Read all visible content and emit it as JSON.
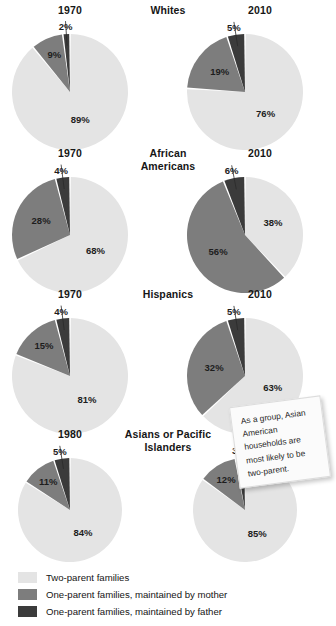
{
  "colors": {
    "two_parent": "#e4e4e4",
    "mother": "#7d7d7d",
    "father": "#3b3b3b",
    "background": "#ffffff",
    "text": "#1a1a1a",
    "gap": "#ffffff"
  },
  "legend": {
    "items": [
      {
        "label": "Two-parent families",
        "color_key": "two_parent",
        "swatch_name": "legend-swatch-two-parent"
      },
      {
        "label": "One-parent families, maintained by mother",
        "color_key": "mother",
        "swatch_name": "legend-swatch-mother"
      },
      {
        "label": "One-parent families, maintained by father",
        "color_key": "father",
        "swatch_name": "legend-swatch-father"
      }
    ]
  },
  "callout": {
    "text": "As a group, Asian American households are most likely to be two-parent."
  },
  "chart_data": {
    "type": "pie",
    "series_labels": [
      "Two-parent families",
      "One-parent families, maintained by mother",
      "One-parent families, maintained by father"
    ],
    "units": "percent",
    "groups": [
      {
        "name": "Whites",
        "name_lines": [
          "Whites"
        ],
        "panels": [
          {
            "year": "1970",
            "values": {
              "two_parent": 89,
              "mother": 9,
              "father": 2
            },
            "labels": {
              "two_parent": "89%",
              "mother": "9%",
              "father": "2%"
            }
          },
          {
            "year": "2010",
            "values": {
              "two_parent": 76,
              "mother": 19,
              "father": 5
            },
            "labels": {
              "two_parent": "76%",
              "mother": "19%",
              "father": "5%"
            }
          }
        ]
      },
      {
        "name": "African Americans",
        "name_lines": [
          "African",
          "Americans"
        ],
        "panels": [
          {
            "year": "1970",
            "values": {
              "two_parent": 68,
              "mother": 28,
              "father": 4
            },
            "labels": {
              "two_parent": "68%",
              "mother": "28%",
              "father": "4%"
            }
          },
          {
            "year": "2010",
            "values": {
              "two_parent": 38,
              "mother": 56,
              "father": 6
            },
            "labels": {
              "two_parent": "38%",
              "mother": "56%",
              "father": "6%"
            }
          }
        ]
      },
      {
        "name": "Hispanics",
        "name_lines": [
          "Hispanics"
        ],
        "panels": [
          {
            "year": "1970",
            "values": {
              "two_parent": 81,
              "mother": 15,
              "father": 4
            },
            "labels": {
              "two_parent": "81%",
              "mother": "15%",
              "father": "4%"
            }
          },
          {
            "year": "2010",
            "values": {
              "two_parent": 63,
              "mother": 32,
              "father": 5
            },
            "labels": {
              "two_parent": "63%",
              "mother": "32%",
              "father": "5%"
            }
          }
        ]
      },
      {
        "name": "Asians or Pacific Islanders",
        "name_lines": [
          "Asians or Pacific",
          "Islanders"
        ],
        "panels": [
          {
            "year": "1980",
            "values": {
              "two_parent": 84,
              "mother": 11,
              "father": 5
            },
            "labels": {
              "two_parent": "84%",
              "mother": "11%",
              "father": "5%"
            }
          },
          {
            "year": "2010",
            "values": {
              "two_parent": 85,
              "mother": 12,
              "father": 3
            },
            "labels": {
              "two_parent": "85%",
              "mother": "12%",
              "father": "3%"
            }
          }
        ]
      }
    ]
  },
  "layout": {
    "section_tops": [
      0,
      143,
      284,
      424
    ],
    "pie_centers_x": [
      70,
      245
    ],
    "pie_radius": [
      58,
      58,
      58,
      52
    ],
    "pie_center_y": [
      88,
      80,
      80,
      72
    ]
  }
}
